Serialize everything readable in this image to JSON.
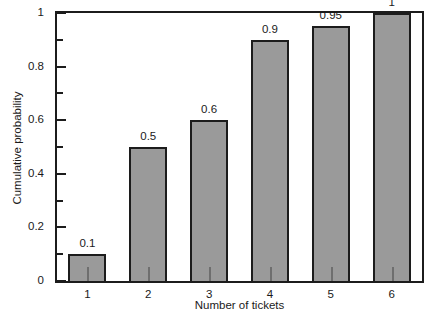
{
  "chart_data": {
    "type": "bar",
    "title": "",
    "subtitle": "",
    "xlabel": "Number of tickets",
    "ylabel": "Cumulative probability",
    "categories": [
      "1",
      "2",
      "3",
      "4",
      "5",
      "6"
    ],
    "values": [
      0.1,
      0.5,
      0.6,
      0.9,
      0.95,
      1
    ],
    "value_labels": [
      "0.1",
      "0.5",
      "0.6",
      "0.9",
      "0.95",
      "1"
    ],
    "ylim": [
      0,
      1
    ],
    "xlim_categories": 6,
    "y_major_ticks": [
      0,
      0.2,
      0.4,
      0.6,
      0.8,
      1
    ],
    "y_major_tick_labels": [
      "0",
      "0.2",
      "0.4",
      "0.6",
      "0.8",
      "1"
    ],
    "y_minor_ticks": [
      0.1,
      0.3,
      0.5,
      0.7,
      0.9
    ],
    "grid": false,
    "legend": null,
    "legend_position": "none",
    "annotations": [],
    "style": {
      "bar_fill": "#9a9a9a",
      "bar_edge": "#1c1c1c",
      "frame_color": "#1c1c1c",
      "background": "#ffffff",
      "text_color": "#1a1a1a"
    }
  }
}
